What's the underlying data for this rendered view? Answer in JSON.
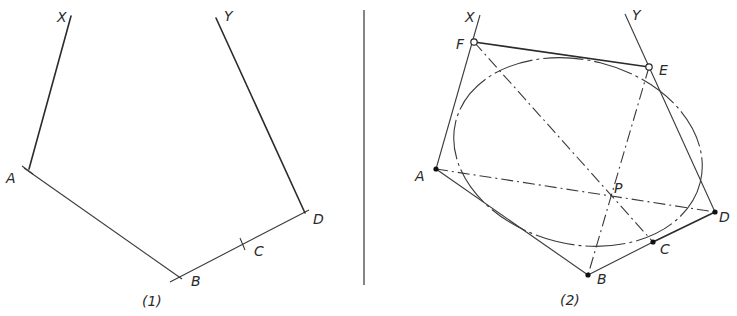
{
  "figure_left": {
    "caption": "(1)",
    "labels": {
      "X": "X",
      "Y": "Y",
      "A": "A",
      "B": "B",
      "C": "C",
      "D": "D"
    }
  },
  "figure_right": {
    "caption": "(2)",
    "labels": {
      "X": "X",
      "Y": "Y",
      "A": "A",
      "B": "B",
      "C": "C",
      "D": "D",
      "E": "E",
      "F": "F",
      "P": "P"
    }
  }
}
